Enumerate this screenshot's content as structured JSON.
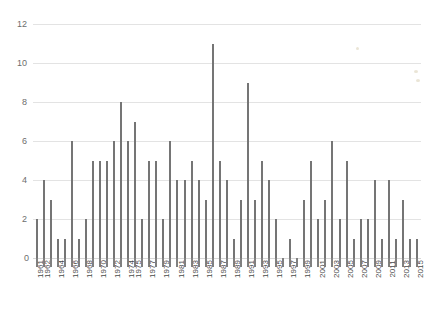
{
  "chart_data": {
    "type": "bar",
    "title": "",
    "subtitle": "",
    "xlabel": "",
    "ylabel": "",
    "ylim": [
      0,
      12
    ],
    "ytick_values": [
      0,
      2,
      4,
      6,
      8,
      10,
      12
    ],
    "ytick_labels": [
      "0",
      "2",
      "4",
      "6",
      "8",
      "10",
      "12"
    ],
    "grid": true,
    "grid_axis": "y",
    "legend": false,
    "legend_position": "none",
    "bar_color": "#757575",
    "gridline_color": "#e3e3e3",
    "label_rotation": -90,
    "xtick_label_interval": 2,
    "categories": [
      "1961",
      "1962",
      "1963",
      "1964",
      "1965",
      "1966",
      "1967",
      "1968",
      "1969",
      "1970",
      "1971",
      "1972",
      "1973",
      "1974",
      "1975",
      "1976",
      "1977",
      "1978",
      "1979",
      "1980",
      "1981",
      "1982",
      "1983",
      "1984",
      "1985",
      "1986",
      "1987",
      "1988",
      "1989",
      "1990",
      "1991",
      "1992",
      "1993",
      "1994",
      "1995",
      "1996",
      "1997",
      "1998",
      "1999",
      "2000",
      "2001",
      "2002",
      "2003",
      "2004",
      "2005",
      "2006",
      "2007",
      "2008",
      "2009",
      "2010",
      "2011",
      "2012",
      "2013",
      "2014",
      "2015"
    ],
    "values": [
      2,
      4,
      3,
      1,
      1,
      6,
      1,
      2,
      5,
      5,
      5,
      6,
      8,
      6,
      7,
      2,
      5,
      5,
      2,
      6,
      4,
      4,
      5,
      4,
      3,
      11,
      5,
      4,
      1,
      3,
      9,
      3,
      5,
      4,
      2,
      0,
      1,
      0,
      3,
      5,
      2,
      3,
      6,
      2,
      5,
      1,
      2,
      2,
      4,
      1,
      4,
      1,
      3,
      1,
      1
    ],
    "visible_xtick_labels": [
      "1961",
      "1962",
      "1964",
      "1966",
      "1968",
      "1970",
      "1972",
      "1974",
      "1975",
      "1977",
      "1979",
      "1981",
      "1983",
      "1985",
      "1987",
      "1989",
      "1991",
      "1993",
      "1995",
      "1997",
      "1999",
      "2001",
      "2003",
      "2005",
      "2007",
      "2009",
      "2011",
      "2013",
      "2015"
    ]
  }
}
